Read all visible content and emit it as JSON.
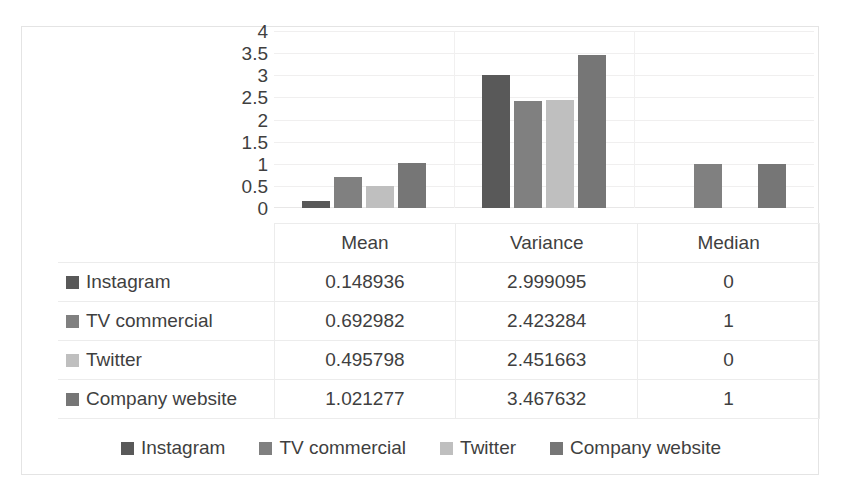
{
  "chart_data": {
    "type": "bar",
    "title": "",
    "subtitle": "",
    "xlabel": "",
    "ylabel": "",
    "categories": [
      "Mean",
      "Variance",
      "Median"
    ],
    "series": [
      {
        "name": "Instagram",
        "color": "#595959",
        "values": [
          0.148936,
          2.999095,
          0
        ]
      },
      {
        "name": "TV commercial",
        "color": "#808080",
        "values": [
          0.692982,
          2.423284,
          1
        ]
      },
      {
        "name": "Twitter",
        "color": "#bfbfbf",
        "values": [
          0.495798,
          2.451663,
          0
        ]
      },
      {
        "name": "Company website",
        "color": "#767676",
        "values": [
          1.021277,
          3.467632,
          1
        ]
      }
    ],
    "ylim": [
      0,
      4
    ],
    "yticks": [
      "0",
      "0.5",
      "1",
      "1.5",
      "2",
      "2.5",
      "3",
      "3.5",
      "4"
    ],
    "ytick_values": [
      0,
      0.5,
      1,
      1.5,
      2,
      2.5,
      3,
      3.5,
      4
    ],
    "grid": true,
    "legend_position": "bottom",
    "data_table_visible": true
  },
  "table": {
    "corner_label": "",
    "column_headers": [
      "Mean",
      "Variance",
      "Median"
    ],
    "rows": [
      {
        "label": "Instagram",
        "color": "#595959",
        "cells": [
          "0.148936",
          "2.999095",
          "0"
        ]
      },
      {
        "label": "TV commercial",
        "color": "#808080",
        "cells": [
          "0.692982",
          "2.423284",
          "1"
        ]
      },
      {
        "label": "Twitter",
        "color": "#bfbfbf",
        "cells": [
          "0.495798",
          "2.451663",
          "0"
        ]
      },
      {
        "label": "Company website",
        "color": "#767676",
        "cells": [
          "1.021277",
          "3.467632",
          "1"
        ]
      }
    ]
  },
  "legend": {
    "items": [
      {
        "label": "Instagram",
        "color": "#595959"
      },
      {
        "label": "TV commercial",
        "color": "#808080"
      },
      {
        "label": "Twitter",
        "color": "#bfbfbf"
      },
      {
        "label": "Company website",
        "color": "#767676"
      }
    ]
  }
}
